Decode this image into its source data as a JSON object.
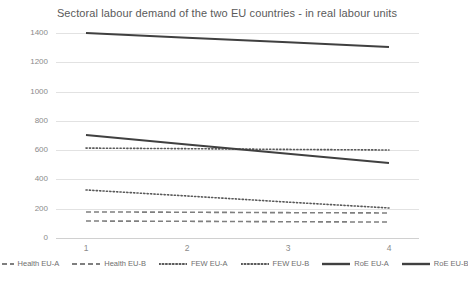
{
  "chart_data": {
    "type": "line",
    "title": "Sectoral labour demand of the two EU countries - in real labour units",
    "xlabel": "",
    "ylabel": "",
    "x": [
      1,
      2,
      3,
      4
    ],
    "xticklabels": [
      "1",
      "2",
      "3",
      "4"
    ],
    "yticklabels": [
      "0",
      "200",
      "400",
      "600",
      "800",
      "1000",
      "1200",
      "1400"
    ],
    "yticks": [
      0,
      200,
      400,
      600,
      800,
      1000,
      1200,
      1400
    ],
    "ylim": [
      0,
      1400
    ],
    "xlim": [
      1,
      4
    ],
    "grid": "horizontal",
    "legend_position": "bottom",
    "series": [
      {
        "name": "Health EU-A",
        "style": "dashed",
        "color": "#7f7f7f",
        "values": [
          178,
          176,
          173,
          171
        ]
      },
      {
        "name": "Health EU-B",
        "style": "dashed",
        "color": "#7f7f7f",
        "values": [
          116,
          114,
          111,
          109
        ]
      },
      {
        "name": "FEW EU-A",
        "style": "dotted",
        "color": "#595959",
        "values": [
          614,
          610,
          605,
          601
        ]
      },
      {
        "name": "FEW EU-B",
        "style": "dotted",
        "color": "#595959",
        "values": [
          328,
          287,
          245,
          205
        ]
      },
      {
        "name": "RoE EU-A",
        "style": "solid",
        "color": "#404040",
        "values": [
          1400,
          1368,
          1336,
          1304
        ]
      },
      {
        "name": "RoE EU-B",
        "style": "solid",
        "color": "#404040",
        "values": [
          703,
          639,
          576,
          512
        ]
      }
    ]
  },
  "colors": {
    "grid": "#e2e2e2",
    "tick_text": "#8b8b8b",
    "title_text": "#5a5a5a",
    "legend_text": "#6f6f6f",
    "background": "#ffffff"
  }
}
